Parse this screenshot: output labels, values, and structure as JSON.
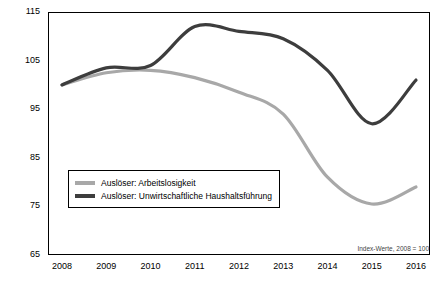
{
  "chart_data": {
    "type": "line",
    "title": "",
    "subtitle": "",
    "xlabel": "",
    "ylabel": "",
    "note": "Index-Werte, 2008 = 100",
    "grid": false,
    "legend_position": "inside-bottom-left",
    "ylim": [
      65,
      115
    ],
    "yticks": [
      65,
      75,
      85,
      95,
      105,
      115
    ],
    "categories": [
      "2008",
      "2009",
      "2010",
      "2011",
      "2012",
      "2013",
      "2014",
      "2015",
      "2016"
    ],
    "series": [
      {
        "name": "Auslöser: Arbeitslosigkeit",
        "color": "#a8a8a8",
        "values": [
          100,
          102.5,
          103,
          101.5,
          98.5,
          94,
          81,
          75.5,
          79
        ]
      },
      {
        "name": "Auslöser: Unwirtschaftliche Haushaltsführung",
        "color": "#3d3d3d",
        "values": [
          100,
          103.5,
          104,
          112,
          111,
          109.5,
          103,
          92,
          101
        ]
      }
    ]
  },
  "legend": {
    "items": [
      {
        "label": "Auslöser: Arbeitslosigkeit",
        "color": "#a8a8a8"
      },
      {
        "label": "Auslöser: Unwirtschaftliche Haushaltsführung",
        "color": "#3d3d3d"
      }
    ]
  },
  "axes": {
    "y_labels": [
      "115",
      "105",
      "95",
      "85",
      "75",
      "65"
    ],
    "x_labels": [
      "2008",
      "2009",
      "2010",
      "2011",
      "2012",
      "2013",
      "2014",
      "2015",
      "2016"
    ]
  },
  "footnote": "Index-Werte, 2008 = 100"
}
